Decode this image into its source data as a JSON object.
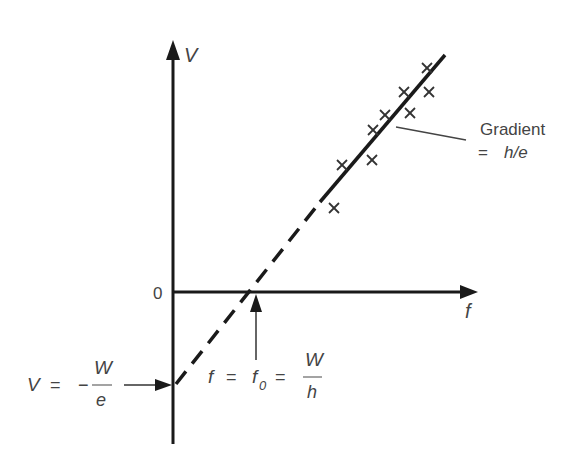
{
  "diagram": {
    "type": "photoelectric-effect-graph",
    "axes": {
      "y_label": "V",
      "x_label": "f",
      "origin_label": "0"
    },
    "gradient_annotation": {
      "line1": "Gradient",
      "line2_eq": "=",
      "line2_value": "h/e"
    },
    "y_intercept_annotation": {
      "lhs": "V",
      "eq": "=",
      "sign": "−",
      "numerator": "W",
      "denominator": "e"
    },
    "x_intercept_annotation": {
      "lhs": "f",
      "eq1": "=",
      "mid": "f",
      "mid_sub": "0",
      "eq2": "=",
      "numerator": "W",
      "denominator": "h"
    },
    "data_points": [
      {
        "x": 334,
        "y": 208
      },
      {
        "x": 342,
        "y": 165
      },
      {
        "x": 372,
        "y": 160
      },
      {
        "x": 373,
        "y": 130
      },
      {
        "x": 385,
        "y": 115
      },
      {
        "x": 404,
        "y": 92
      },
      {
        "x": 410,
        "y": 113
      },
      {
        "x": 429,
        "y": 92
      },
      {
        "x": 427,
        "y": 68
      }
    ],
    "colors": {
      "line": "#1a1a1a",
      "text": "#444444",
      "marker": "#333333"
    }
  }
}
